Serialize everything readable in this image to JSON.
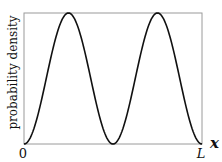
{
  "chart_data": {
    "type": "line",
    "title": "",
    "xlabel": "x",
    "ylabel": "probability density",
    "x_tick_labels": [
      "0",
      "L"
    ],
    "xlim": [
      0,
      1
    ],
    "ylim": [
      0,
      1
    ],
    "grid": false,
    "legend": "none",
    "function": "sin^2(2*pi*x/L)",
    "series": [
      {
        "name": "probability density",
        "x": [
          0,
          0.0625,
          0.125,
          0.1875,
          0.25,
          0.3125,
          0.375,
          0.4375,
          0.5,
          0.5625,
          0.625,
          0.6875,
          0.75,
          0.8125,
          0.875,
          0.9375,
          1
        ],
        "values": [
          0,
          0.146,
          0.5,
          0.854,
          1,
          0.854,
          0.5,
          0.146,
          0,
          0.146,
          0.5,
          0.854,
          1,
          0.854,
          0.5,
          0.146,
          0
        ]
      }
    ]
  }
}
